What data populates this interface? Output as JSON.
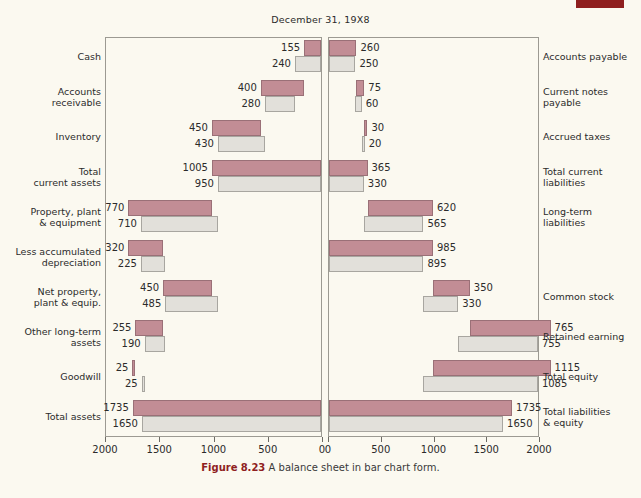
{
  "figure": {
    "title": "December 31, 19X8",
    "caption_label": "Figure",
    "caption_number": "8.23",
    "caption_text": "A balance sheet in bar chart form.",
    "accent_color": "#8f1f1f",
    "bar_top_color": "#c28d95",
    "bar_bottom_color": "#e2e0da",
    "background_color": "#fbf9f0"
  },
  "axis": {
    "left_ticks": [
      "2000",
      "1500",
      "1000",
      "500",
      "0"
    ],
    "right_ticks": [
      "0",
      "500",
      "1000",
      "1500",
      "2000"
    ],
    "max": 2000,
    "direction_left": "reversed",
    "direction_right": "normal"
  },
  "chart_data": {
    "type": "bar",
    "title": "December 31, 19X8",
    "xlabel": "",
    "ylabel": "",
    "xlim": [
      0,
      2000
    ],
    "grid": false,
    "legend": [],
    "orientation": "horizontal-bidirectional",
    "note": "Assets plotted leftward from the center, Liabilities & Equity plotted rightward. Each row has two bars: current year (rose, top) and prior year (gray, bottom).",
    "series": [
      {
        "name": "Current year",
        "color": "#c28d95"
      },
      {
        "name": "Prior year",
        "color": "#e2e0da"
      }
    ],
    "assets": [
      {
        "label": "Cash",
        "current": 155,
        "prior": 240,
        "stack_offset_current": 0,
        "stack_offset_prior": 0
      },
      {
        "label": "Accounts\nreceivable",
        "current": 400,
        "prior": 280,
        "stack_offset_current": 155,
        "stack_offset_prior": 240
      },
      {
        "label": "Inventory",
        "current": 450,
        "prior": 430,
        "stack_offset_current": 555,
        "stack_offset_prior": 520
      },
      {
        "label": "Total\ncurrent assets",
        "current": 1005,
        "prior": 950,
        "stack_offset_current": 0,
        "stack_offset_prior": 0
      },
      {
        "label": "Property, plant\n& equipment",
        "current": 770,
        "prior": 710,
        "stack_offset_current": 1005,
        "stack_offset_prior": 950
      },
      {
        "label": "Less accumulated\ndepreciation",
        "current": 320,
        "prior": 225,
        "stack_offset_current": 1455,
        "stack_offset_prior": 1435
      },
      {
        "label": "Net property,\nplant & equip.",
        "current": 450,
        "prior": 485,
        "stack_offset_current": 1005,
        "stack_offset_prior": 950
      },
      {
        "label": "Other long-term\nassets",
        "current": 255,
        "prior": 190,
        "stack_offset_current": 1455,
        "stack_offset_prior": 1435
      },
      {
        "label": "Goodwill",
        "current": 25,
        "prior": 25,
        "stack_offset_current": 1710,
        "stack_offset_prior": 1625
      },
      {
        "label": "Total assets",
        "current": 1735,
        "prior": 1650,
        "stack_offset_current": 0,
        "stack_offset_prior": 0
      }
    ],
    "liabilities": [
      {
        "label": "Accounts payable",
        "current": 260,
        "prior": 250,
        "stack_offset_current": 0,
        "stack_offset_prior": 0
      },
      {
        "label": "Current notes\npayable",
        "current": 75,
        "prior": 60,
        "stack_offset_current": 260,
        "stack_offset_prior": 250
      },
      {
        "label": "Accrued taxes",
        "current": 30,
        "prior": 20,
        "stack_offset_current": 335,
        "stack_offset_prior": 310
      },
      {
        "label": "Total current\nliabilities",
        "current": 365,
        "prior": 330,
        "stack_offset_current": 0,
        "stack_offset_prior": 0
      },
      {
        "label": "Long-term\nliabilities",
        "current": 620,
        "prior": 565,
        "stack_offset_current": 365,
        "stack_offset_prior": 330
      },
      {
        "label": "",
        "current": 985,
        "prior": 895,
        "stack_offset_current": 0,
        "stack_offset_prior": 0,
        "unlabeled": true
      },
      {
        "label": "Common stock",
        "current": 350,
        "prior": 330,
        "stack_offset_current": 985,
        "stack_offset_prior": 895
      },
      {
        "label": "Retained earning",
        "current": 765,
        "prior": 755,
        "stack_offset_current": 1335,
        "stack_offset_prior": 1225
      },
      {
        "label": "Total equity",
        "current": 1115,
        "prior": 1085,
        "stack_offset_current": 985,
        "stack_offset_prior": 895
      },
      {
        "label": "Total liabilities\n& equity",
        "current": 1735,
        "prior": 1650,
        "stack_offset_current": 0,
        "stack_offset_prior": 0
      }
    ]
  }
}
